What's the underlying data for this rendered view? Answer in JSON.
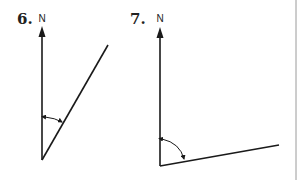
{
  "figures": [
    {
      "number": "6.",
      "north_label": "N",
      "description": "North arrow with a line at an acute angle clockwise from north; angle marked by a double-headed arc"
    },
    {
      "number": "7.",
      "north_label": "N",
      "description": "North arrow with a line nearly due east (slightly above horizontal); obtuse angle marked by a double-headed arc"
    }
  ],
  "colors": {
    "ink": "#1a1a1a",
    "background": "#ffffff",
    "border": "#9a9a9a"
  }
}
